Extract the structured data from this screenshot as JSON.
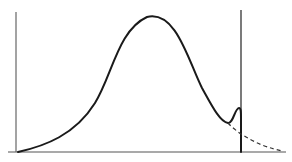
{
  "figure": {
    "type": "distribution-curve-diagram",
    "width": 292,
    "height": 162,
    "colors": {
      "background": "#ffffff",
      "ink": "#1a1a1a",
      "axis": "#555555"
    },
    "axes": {
      "baseline": {
        "x1": 8,
        "y1": 152,
        "x2": 286,
        "y2": 152
      },
      "left_axis": {
        "x1": 16,
        "y1": 12,
        "x2": 16,
        "y2": 152
      },
      "cutoff_line": {
        "x1": 241,
        "y1": 10,
        "x2": 241,
        "y2": 152
      }
    },
    "curves": {
      "main_solid": "M 18 152 C 45 146, 75 135, 95 103 C 112 76, 118 30, 147 17 C 176 10, 188 60, 202 88 C 212 106, 220 122, 228 123 C 233 124, 235 108, 239 108 C 241 108, 241 112, 241 118 L 241 152",
      "tail_dashed": "M 228 123 C 236 132, 250 140, 262 145 C 270 148, 277 150, 283 151"
    },
    "labels": []
  }
}
